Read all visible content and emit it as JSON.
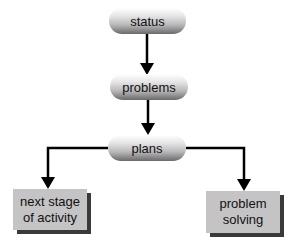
{
  "diagram": {
    "type": "flowchart",
    "nodes": {
      "status": {
        "label": "status"
      },
      "problems": {
        "label": "problems"
      },
      "plans": {
        "label": "plans"
      },
      "next_stage": {
        "line1": "next stage",
        "line2": "of activity"
      },
      "problem_solving": {
        "line1": "problem",
        "line2": "solving"
      }
    },
    "edges": [
      {
        "from": "status",
        "to": "problems"
      },
      {
        "from": "problems",
        "to": "plans"
      },
      {
        "from": "plans",
        "to": "next stage of activity"
      },
      {
        "from": "plans",
        "to": "problem solving"
      }
    ],
    "colors": {
      "line": "#000000",
      "box_fill": "#c4c4c4",
      "box_shadow": "#3a3a3a"
    }
  }
}
